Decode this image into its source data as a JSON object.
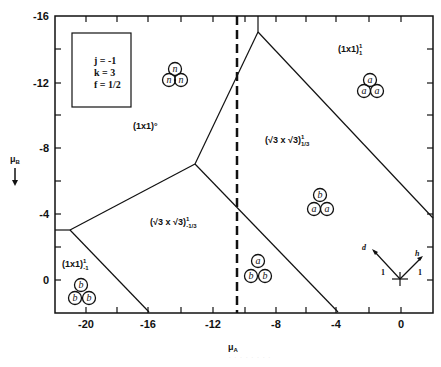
{
  "figure": {
    "type": "phase-diagram",
    "parameters": {
      "j": "j = -1",
      "k": "k = 3",
      "f": "f = 1/2"
    },
    "axes": {
      "x": {
        "label": "μA",
        "label_main": "μ",
        "label_sub": "A",
        "ticks": [
          "-20",
          "-16",
          "-12",
          "-8",
          "-4",
          "0"
        ],
        "range": [
          -22,
          2
        ]
      },
      "y": {
        "label": "μB",
        "label_main": "μ",
        "label_sub": "B",
        "arrow": "↓",
        "ticks": [
          "-16",
          "-12",
          "-8",
          "-4",
          "0"
        ],
        "range": [
          -16,
          2
        ],
        "inverted": true
      }
    },
    "regions": [
      {
        "name": "(1x1)°",
        "label_main": "(1x1)",
        "label_sup": "°",
        "atoms": [
          "n",
          "n",
          "n"
        ]
      },
      {
        "name": "(1x1)^1_1",
        "label_main": "(1x1)",
        "label_sup": "1",
        "label_sub": "1",
        "atoms": [
          "a",
          "a",
          "a"
        ]
      },
      {
        "name": "(√3x√3)^1_1/3",
        "label_main": "(√3 x √3)",
        "label_sup": "1",
        "label_sub": "1/3",
        "atoms": [
          "b",
          "a",
          "a"
        ]
      },
      {
        "name": "(√3x√3)^1_-1/3",
        "label_main": "(√3 x √3)",
        "label_sup": "1",
        "label_sub": "-1/3",
        "atoms": [
          "a",
          "b",
          "b"
        ]
      },
      {
        "name": "(1x1)^1_-1",
        "label_main": "(1x1)",
        "label_sup": "1",
        "label_sub": "-1",
        "atoms": [
          "b",
          "b",
          "b"
        ]
      }
    ],
    "phase_boundaries": [
      {
        "from": [
          -22,
          -3
        ],
        "to": [
          -21,
          -3
        ]
      },
      {
        "from": [
          -21,
          -3
        ],
        "to": [
          -13,
          -7
        ]
      },
      {
        "from": [
          -21,
          -3
        ],
        "to": [
          -16,
          2
        ]
      },
      {
        "from": [
          -13,
          -7
        ],
        "to": [
          -9,
          -15
        ]
      },
      {
        "from": [
          -13,
          -7
        ],
        "to": [
          -4,
          2
        ]
      },
      {
        "from": [
          -9,
          -15
        ],
        "to": [
          -9,
          -16
        ]
      },
      {
        "from": [
          -9,
          -15
        ],
        "to": [
          2,
          -4
        ]
      }
    ],
    "dashed_line": {
      "x": -10.3
    },
    "inset": {
      "arrow_d_label": "d",
      "arrow_h_label": "h",
      "unit_left": "1",
      "unit_right": "1"
    },
    "caption": "· · · · · · · ·"
  }
}
